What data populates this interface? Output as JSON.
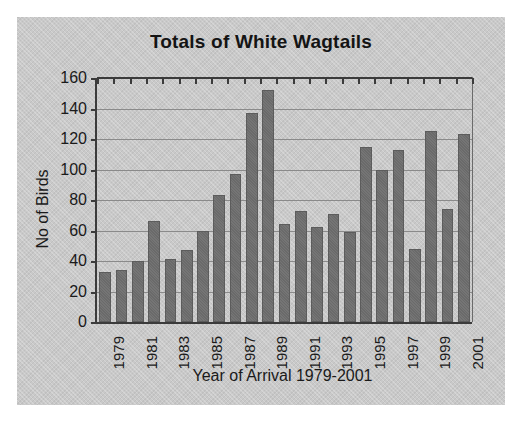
{
  "chart_data": {
    "type": "bar",
    "title": "Totals of White Wagtails",
    "xlabel": "Year of Arrival 1979-2001",
    "ylabel": "No of Birds",
    "ylim": [
      0,
      160
    ],
    "ytick_step": 20,
    "yticks": [
      0,
      20,
      40,
      60,
      80,
      100,
      120,
      140,
      160
    ],
    "grid": true,
    "legend": "none",
    "bar_color": "#6e6e6e",
    "plot_background": "#c9c9c9",
    "categories": [
      "1979",
      "1980",
      "1981",
      "1982",
      "1983",
      "1984",
      "1985",
      "1986",
      "1987",
      "1988",
      "1989",
      "1990",
      "1991",
      "1992",
      "1993",
      "1994",
      "1995",
      "1996",
      "1997",
      "1998",
      "1999",
      "2000",
      "2001"
    ],
    "visible_tick_labels": [
      "1979",
      "1981",
      "1983",
      "1985",
      "1987",
      "1989",
      "1991",
      "1993",
      "1995",
      "1997",
      "1999",
      "2001"
    ],
    "values": [
      33,
      34,
      40,
      66,
      41,
      47,
      60,
      83,
      97,
      137,
      152,
      64,
      73,
      62,
      71,
      59,
      115,
      100,
      113,
      48,
      125,
      74,
      123
    ]
  }
}
